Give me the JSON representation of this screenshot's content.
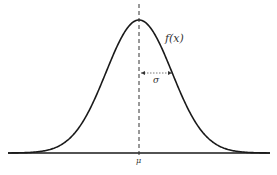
{
  "diagram": {
    "type": "normal-distribution-curve",
    "curve_label": "f(x)",
    "mean_label": "μ",
    "sd_label": "σ",
    "colors": {
      "curve": "#1a1a1a",
      "axis": "#1a1a1a",
      "dashed_line": "#333333",
      "text": "#333333"
    }
  }
}
